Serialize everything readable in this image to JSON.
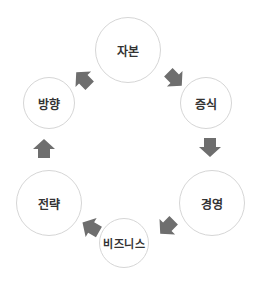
{
  "diagram": {
    "type": "cycle",
    "arrow_color": "#6e6e6e",
    "circle_border_color": "#d6d6d6",
    "text_color": "#333333",
    "nodes": [
      {
        "label": "자본",
        "cx": 128,
        "cy": 50,
        "r": 33
      },
      {
        "label": "증식",
        "cx": 206,
        "cy": 103,
        "r": 26
      },
      {
        "label": "경영",
        "cx": 212,
        "cy": 203,
        "r": 33
      },
      {
        "label": "비즈니스",
        "cx": 124,
        "cy": 243,
        "r": 25
      },
      {
        "label": "전략",
        "cx": 49,
        "cy": 203,
        "r": 33
      },
      {
        "label": "방향",
        "cx": 49,
        "cy": 103,
        "r": 26
      }
    ],
    "edges": [
      {
        "from": "자본",
        "to": "증식"
      },
      {
        "from": "증식",
        "to": "경영"
      },
      {
        "from": "경영",
        "to": "비즈니스"
      },
      {
        "from": "비즈니스",
        "to": "전략"
      },
      {
        "from": "전략",
        "to": "방향"
      },
      {
        "from": "방향",
        "to": "자본"
      }
    ]
  }
}
